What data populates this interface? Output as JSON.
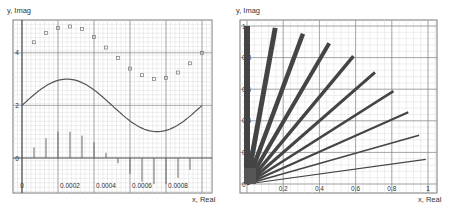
{
  "chart_data": [
    {
      "type": "line",
      "ylabel": "y, Imag",
      "xlabel": "x, Real",
      "xlim": [
        0,
        0.001
      ],
      "ylim": [
        -0.8,
        5.3
      ],
      "grid": true,
      "x_ticks": [
        "0",
        "0.0002",
        "0.0004",
        "0.0006",
        "0.0008"
      ],
      "y_ticks": [
        "0",
        "2",
        "4"
      ],
      "series": [
        {
          "name": "curve",
          "style": "line",
          "x": [
            0,
            0.0001,
            0.0002,
            0.00025,
            0.0003,
            0.0004,
            0.0005,
            0.0006,
            0.0007,
            0.00075,
            0.0008,
            0.0009,
            0.001
          ],
          "values": [
            2.0,
            2.59,
            2.95,
            3.0,
            2.95,
            2.59,
            2.0,
            1.41,
            1.05,
            1.0,
            1.05,
            1.41,
            2.0
          ]
        },
        {
          "name": "points",
          "style": "scatter",
          "x": [
            6.67e-05,
            0.0001333,
            0.0002,
            0.0002667,
            0.0003333,
            0.0004,
            0.0004667,
            0.0005333,
            0.0006,
            0.0006667,
            0.0007333,
            0.0008,
            0.0008667,
            0.0009333,
            0.001
          ],
          "values": [
            4.4,
            4.75,
            4.95,
            5.0,
            4.9,
            4.6,
            4.2,
            3.8,
            3.4,
            3.15,
            3.0,
            3.05,
            3.25,
            3.6,
            4.0
          ]
        },
        {
          "name": "stems",
          "style": "stem",
          "x": [
            6.67e-05,
            0.0001333,
            0.0002,
            0.0002667,
            0.0003333,
            0.0004,
            0.0004667,
            0.0005333,
            0.0006,
            0.0006667,
            0.0007333,
            0.0008,
            0.0008667,
            0.0009333
          ],
          "values": [
            0.4,
            0.75,
            1.0,
            1.0,
            0.85,
            0.6,
            0.2,
            -0.2,
            -0.6,
            -0.9,
            -1.0,
            -1.0,
            -0.75,
            -0.45
          ]
        }
      ]
    },
    {
      "type": "line",
      "ylabel": "y, Imag",
      "xlabel": "x, Real",
      "xlim": [
        0,
        1
      ],
      "ylim": [
        0,
        1
      ],
      "grid": true,
      "x_ticks": [
        "0",
        "0.2",
        "0.4",
        "0.6",
        "0.8",
        "1"
      ],
      "y_ticks": [
        "0",
        "0.2",
        "0.4",
        "0.6",
        "0.8",
        "1"
      ],
      "series": [
        {
          "name": "ray-0",
          "x": [
            0,
            0.0
          ],
          "values": [
            0,
            1.0
          ],
          "width": 6
        },
        {
          "name": "ray-1",
          "x": [
            0,
            0.156
          ],
          "values": [
            0,
            0.988
          ],
          "width": 5
        },
        {
          "name": "ray-2",
          "x": [
            0,
            0.309
          ],
          "values": [
            0,
            0.951
          ],
          "width": 4.5
        },
        {
          "name": "ray-3",
          "x": [
            0,
            0.454
          ],
          "values": [
            0,
            0.891
          ],
          "width": 4
        },
        {
          "name": "ray-4",
          "x": [
            0,
            0.588
          ],
          "values": [
            0,
            0.809
          ],
          "width": 3.5
        },
        {
          "name": "ray-5",
          "x": [
            0,
            0.707
          ],
          "values": [
            0,
            0.707
          ],
          "width": 3
        },
        {
          "name": "ray-6",
          "x": [
            0,
            0.809
          ],
          "values": [
            0,
            0.588
          ],
          "width": 2.5
        },
        {
          "name": "ray-7",
          "x": [
            0,
            0.891
          ],
          "values": [
            0,
            0.454
          ],
          "width": 2
        },
        {
          "name": "ray-8",
          "x": [
            0,
            0.951
          ],
          "values": [
            0,
            0.309
          ],
          "width": 1.5
        },
        {
          "name": "ray-9",
          "x": [
            0,
            0.988
          ],
          "values": [
            0,
            0.156
          ],
          "width": 1.2
        }
      ]
    }
  ],
  "left": {
    "ylabel": "y, Imag",
    "xlabel": "x, Real"
  },
  "right": {
    "ylabel": "y, Imag",
    "xlabel": "x, Real"
  },
  "colors": {
    "line": "#555555",
    "grid_major": "#888888",
    "grid_minor": "#dddddd",
    "frame": "#777777"
  }
}
